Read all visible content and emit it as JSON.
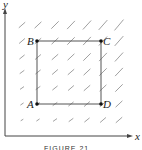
{
  "figure": {
    "caption": "FIGURE 21",
    "axes": {
      "x_label": "x",
      "y_label": "y"
    },
    "points": [
      {
        "label": "A",
        "px": 37,
        "py": 104
      },
      {
        "label": "B",
        "px": 37,
        "py": 41
      },
      {
        "label": "C",
        "px": 101,
        "py": 41
      },
      {
        "label": "D",
        "px": 101,
        "py": 104
      }
    ],
    "rectangle": [
      "A",
      "B",
      "C",
      "D"
    ],
    "slope_field": {
      "columns_px": [
        22,
        38,
        55,
        71,
        87,
        103,
        119
      ],
      "rows_px": [
        25,
        41,
        57,
        72,
        88,
        104,
        120
      ],
      "direction": "positive slope, segment length grows toward upper-right"
    },
    "colors": {
      "axis": "#444444",
      "rectangle": "#555555",
      "segment": "#888888",
      "point": "#111111"
    }
  }
}
